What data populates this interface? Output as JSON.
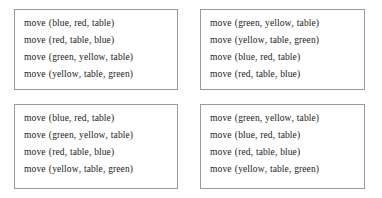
{
  "figure": {
    "background_color": "#ffffff",
    "border_color": "#9a9a9a",
    "text_color": "#1a1a1a"
  },
  "boxes": [
    {
      "id": "plan-box-top-left",
      "lines": [
        {
          "operator": "move",
          "args": [
            "blue",
            "red",
            "table"
          ]
        },
        {
          "operator": "move",
          "args": [
            "red",
            "table",
            "blue"
          ]
        },
        {
          "operator": "move",
          "args": [
            "green",
            "yellow",
            "table"
          ]
        },
        {
          "operator": "move",
          "args": [
            "yellow",
            "table",
            "green"
          ]
        }
      ]
    },
    {
      "id": "plan-box-top-right",
      "lines": [
        {
          "operator": "move",
          "args": [
            "green",
            "yellow",
            "table"
          ]
        },
        {
          "operator": "move",
          "args": [
            "yellow",
            "table",
            "green"
          ]
        },
        {
          "operator": "move",
          "args": [
            "blue",
            "red",
            "table"
          ]
        },
        {
          "operator": "move",
          "args": [
            "red",
            "table",
            "blue"
          ]
        }
      ]
    },
    {
      "id": "plan-box-bottom-left",
      "lines": [
        {
          "operator": "move",
          "args": [
            "blue",
            "red",
            "table"
          ]
        },
        {
          "operator": "move",
          "args": [
            "green",
            "yellow",
            "table"
          ]
        },
        {
          "operator": "move",
          "args": [
            "red",
            "table",
            "blue"
          ]
        },
        {
          "operator": "move",
          "args": [
            "yellow",
            "table",
            "green"
          ]
        }
      ]
    },
    {
      "id": "plan-box-bottom-right",
      "lines": [
        {
          "operator": "move",
          "args": [
            "green",
            "yellow",
            "table"
          ]
        },
        {
          "operator": "move",
          "args": [
            "blue",
            "red",
            "table"
          ]
        },
        {
          "operator": "move",
          "args": [
            "red",
            "table",
            "blue"
          ]
        },
        {
          "operator": "move",
          "args": [
            "yellow",
            "table",
            "green"
          ]
        }
      ]
    }
  ],
  "punctuation": {
    "open_paren": "(",
    "close_paren": ")",
    "separator": ","
  }
}
